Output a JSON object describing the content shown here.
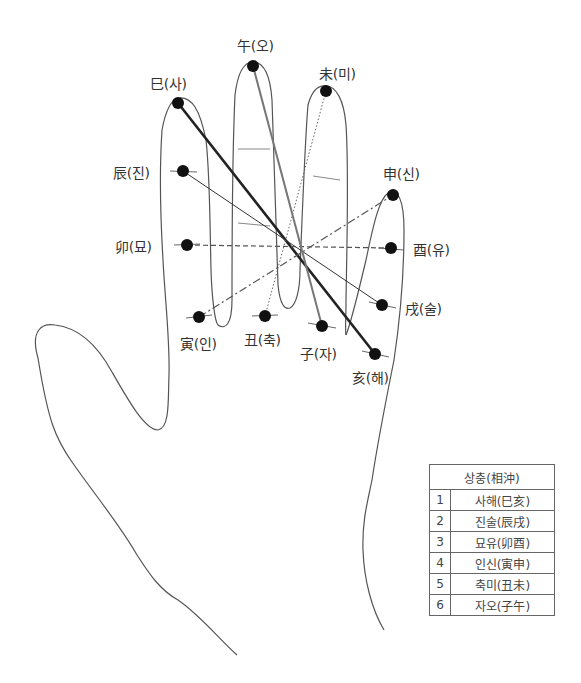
{
  "diagram": {
    "title": "상충(相沖)",
    "points": [
      {
        "id": "sa",
        "label": "巳(사)",
        "x": 178,
        "y": 103
      },
      {
        "id": "o",
        "label": "午(오)",
        "x": 253,
        "y": 66
      },
      {
        "id": "mi",
        "label": "未(미)",
        "x": 326,
        "y": 91
      },
      {
        "id": "sin",
        "label": "申(신)",
        "x": 393,
        "y": 195
      },
      {
        "id": "jin",
        "label": "辰(진)",
        "x": 183,
        "y": 171
      },
      {
        "id": "myo",
        "label": "卯(묘)",
        "x": 187,
        "y": 245
      },
      {
        "id": "yu",
        "label": "酉(유)",
        "x": 391,
        "y": 248
      },
      {
        "id": "sul",
        "label": "戌(술)",
        "x": 382,
        "y": 305
      },
      {
        "id": "in",
        "label": "寅(인)",
        "x": 199,
        "y": 317
      },
      {
        "id": "chuk",
        "label": "丑(축)",
        "x": 265,
        "y": 316
      },
      {
        "id": "ja",
        "label": "子(자)",
        "x": 322,
        "y": 326
      },
      {
        "id": "hae",
        "label": "亥(해)",
        "x": 375,
        "y": 354
      }
    ],
    "connections": [
      {
        "from": "sa",
        "to": "hae",
        "style": "thick-solid"
      },
      {
        "from": "jin",
        "to": "sul",
        "style": "thin-solid"
      },
      {
        "from": "myo",
        "to": "yu",
        "style": "dashed"
      },
      {
        "from": "in",
        "to": "sin",
        "style": "dash-dot"
      },
      {
        "from": "chuk",
        "to": "mi",
        "style": "dotted"
      },
      {
        "from": "ja",
        "to": "o",
        "style": "gray-solid"
      }
    ]
  },
  "labels": {
    "sa": "巳(사)",
    "o": "午(오)",
    "mi": "未(미)",
    "sin": "申(신)",
    "jin": "辰(진)",
    "myo": "卯(묘)",
    "yu": "酉(유)",
    "sul": "戌(술)",
    "in": "寅(인)",
    "chuk": "丑(축)",
    "ja": "子(자)",
    "hae": "亥(해)"
  },
  "legend": {
    "header": "상충(相沖)",
    "rows": [
      {
        "num": "1",
        "pair": "사해(巳亥)"
      },
      {
        "num": "2",
        "pair": "진술(辰戌)"
      },
      {
        "num": "3",
        "pair": "묘유(卯酉)"
      },
      {
        "num": "4",
        "pair": "인신(寅申)"
      },
      {
        "num": "5",
        "pair": "축미(丑未)"
      },
      {
        "num": "6",
        "pair": "자오(子午)"
      }
    ]
  },
  "colors": {
    "outline": "#555555",
    "dot": "#111111",
    "thick_line": "#222222",
    "gray_line": "#777777"
  }
}
